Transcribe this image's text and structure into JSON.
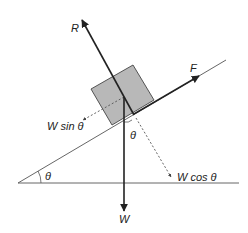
{
  "diagram": {
    "labels": {
      "normal_force": "R",
      "applied_force": "F",
      "weight": "W",
      "w_parallel": "W sin θ",
      "w_perpendicular": "W cos θ",
      "incline_angle": "θ",
      "angle_at_block": "θ"
    },
    "colors": {
      "line": "#222222",
      "block_fill": "#b8b8b8",
      "block_stroke": "#333333",
      "dashed": "#555555"
    }
  }
}
